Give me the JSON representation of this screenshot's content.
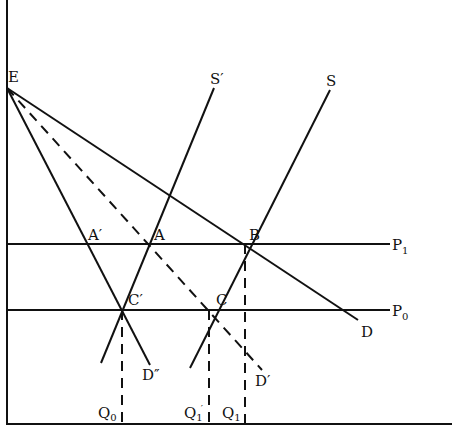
{
  "diagram": {
    "type": "supply-demand",
    "axes": {
      "origin": [
        7,
        424
      ],
      "y_top": 0,
      "x_right": 452
    },
    "labels": {
      "E": "E",
      "S_prime": "S′",
      "S": "S",
      "A_prime": "A′",
      "A": "A",
      "B": "B",
      "C_prime": "C′",
      "C": "C",
      "P1": "P",
      "P1_sub": "1",
      "P0": "P",
      "P0_sub": "0",
      "D": "D",
      "D_double_prime": "D″",
      "D_prime": "D′",
      "Q0": "Q",
      "Q0_sub": "0",
      "Q1_prime": "Q",
      "Q1_prime_sub": "1",
      "Q1_prime_mark": "′",
      "Q1": "Q",
      "Q1_sub": "1"
    },
    "points": {
      "E": [
        7,
        88
      ],
      "A_prime": [
        87,
        244
      ],
      "A": [
        149,
        244
      ],
      "B": [
        244,
        244
      ],
      "C_prime": [
        121,
        310
      ],
      "C": [
        207,
        310
      ]
    },
    "lines": [
      {
        "name": "P1",
        "from": [
          7,
          244
        ],
        "to": [
          390,
          244
        ],
        "style": "solid"
      },
      {
        "name": "P0",
        "from": [
          7,
          310
        ],
        "to": [
          390,
          310
        ],
        "style": "solid"
      },
      {
        "name": "D",
        "from": [
          7,
          88
        ],
        "to": [
          358,
          320
        ],
        "style": "solid"
      },
      {
        "name": "D-double-prime",
        "from": [
          7,
          88
        ],
        "to": [
          150,
          365
        ],
        "style": "solid"
      },
      {
        "name": "D-prime",
        "from": [
          7,
          88
        ],
        "to": [
          262,
          370
        ],
        "style": "dashed"
      },
      {
        "name": "S-prime",
        "from": [
          214,
          88
        ],
        "to": [
          101,
          363
        ],
        "style": "solid"
      },
      {
        "name": "S",
        "from": [
          330,
          90
        ],
        "to": [
          190,
          368
        ],
        "style": "solid"
      },
      {
        "name": "Q0-drop",
        "from": [
          122,
          310
        ],
        "to": [
          122,
          424
        ],
        "style": "dashed"
      },
      {
        "name": "Q1-prime-drop",
        "from": [
          209,
          310
        ],
        "to": [
          209,
          424
        ],
        "style": "dashed"
      },
      {
        "name": "Q1-drop",
        "from": [
          245,
          244
        ],
        "to": [
          245,
          424
        ],
        "style": "dashed"
      }
    ]
  }
}
